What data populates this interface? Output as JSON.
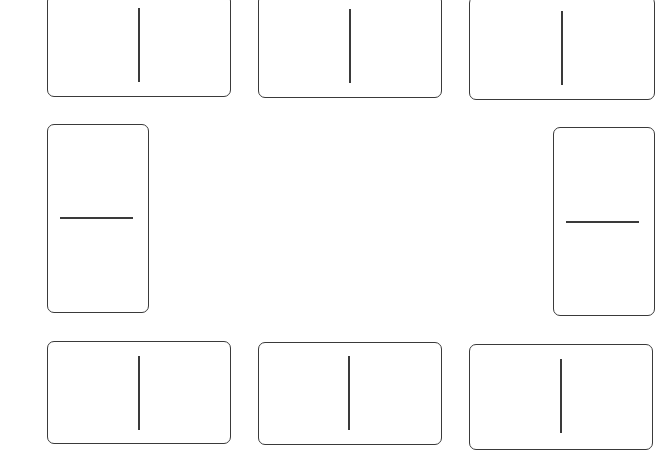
{
  "diagram": {
    "type": "domino-tiles",
    "stroke_color": "#3a3a3a",
    "background": "#ffffff",
    "tiles": [
      {
        "id": "top-left",
        "orientation": "horizontal",
        "left_pips": 0,
        "right_pips": 0
      },
      {
        "id": "top-middle",
        "orientation": "horizontal",
        "left_pips": 0,
        "right_pips": 0
      },
      {
        "id": "top-right",
        "orientation": "horizontal",
        "left_pips": 0,
        "right_pips": 0
      },
      {
        "id": "middle-left",
        "orientation": "vertical",
        "top_pips": 0,
        "bottom_pips": 0
      },
      {
        "id": "middle-right",
        "orientation": "vertical",
        "top_pips": 0,
        "bottom_pips": 0
      },
      {
        "id": "bottom-left",
        "orientation": "horizontal",
        "left_pips": 0,
        "right_pips": 0
      },
      {
        "id": "bottom-middle",
        "orientation": "horizontal",
        "left_pips": 0,
        "right_pips": 0
      },
      {
        "id": "bottom-right",
        "orientation": "horizontal",
        "left_pips": 0,
        "right_pips": 0
      }
    ]
  }
}
